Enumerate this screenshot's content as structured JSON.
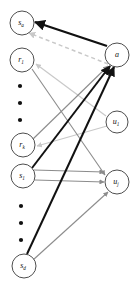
{
  "figure": {
    "background": "#ffffff"
  },
  "colors": {
    "node_stroke": "#3a3a3a",
    "node_fill": "#ffffff",
    "label": "#111111",
    "edge_black": "#111111",
    "edge_gray": "#8c8c8c",
    "edge_light_gray": "#c9c9c9",
    "edge_dashed_gray": "#c9c9c9"
  },
  "nodes": {
    "left": [
      {
        "id": "s_a",
        "base": "s",
        "sub": "a",
        "label": "s_a",
        "cx": 22,
        "cy": 23,
        "r": 12
      },
      {
        "id": "r_1",
        "base": "r",
        "sub": "1",
        "label": "r_1",
        "cx": 22,
        "cy": 60,
        "r": 12
      },
      {
        "id": "r_k",
        "base": "r",
        "sub": "k",
        "label": "r_k",
        "cx": 23,
        "cy": 145,
        "r": 12
      },
      {
        "id": "s_1",
        "base": "s",
        "sub": "1",
        "label": "s_1",
        "cx": 23,
        "cy": 176,
        "r": 12
      },
      {
        "id": "s_d",
        "base": "s",
        "sub": "d",
        "label": "s_d",
        "cx": 24,
        "cy": 266,
        "r": 12
      }
    ],
    "right": [
      {
        "id": "a",
        "base": "a",
        "sub": "",
        "label": "a",
        "cx": 117,
        "cy": 55,
        "r": 12
      },
      {
        "id": "u_1",
        "base": "u",
        "sub": "1",
        "label": "u_1",
        "cx": 117,
        "cy": 122,
        "r": 11
      },
      {
        "id": "u_j",
        "base": "u",
        "sub": "j",
        "label": "u_j",
        "cx": 117,
        "cy": 182,
        "r": 12
      }
    ]
  },
  "ellipses": [
    {
      "group": "left-upper",
      "cx": 20,
      "dots": [
        86,
        103,
        120
      ],
      "r": 2.1
    },
    {
      "group": "left-lower",
      "cx": 21,
      "dots": [
        206,
        223,
        240
      ],
      "r": 2.1
    }
  ],
  "edges": [
    {
      "id": "e1",
      "from": "a",
      "to": "s_a",
      "style": "solid",
      "color": "#111111",
      "width": 2.2,
      "arrow": "black"
    },
    {
      "id": "e2",
      "from": "a",
      "to": "s_a",
      "style": "dashed",
      "color": "#c9c9c9",
      "width": 1.4,
      "arrow": "light"
    },
    {
      "id": "e3",
      "from": "u_1",
      "to": "r_1",
      "style": "solid",
      "color": "#c9c9c9",
      "width": 1.2,
      "arrow": "light"
    },
    {
      "id": "e4",
      "from": "u_1",
      "to": "r_k",
      "style": "solid",
      "color": "#c9c9c9",
      "width": 1.2,
      "arrow": "light"
    },
    {
      "id": "e5",
      "from": "r_1",
      "to": "u_j",
      "style": "solid",
      "color": "#8c8c8c",
      "width": 1.1,
      "arrow": "gray"
    },
    {
      "id": "e6",
      "from": "r_k",
      "to": "a",
      "style": "solid",
      "color": "#8c8c8c",
      "width": 1.1,
      "arrow": "gray"
    },
    {
      "id": "e7",
      "from": "s_1",
      "to": "a",
      "style": "solid",
      "color": "#111111",
      "width": 2.0,
      "arrow": "black"
    },
    {
      "id": "e8",
      "from": "s_1",
      "to": "u_j",
      "style": "solid",
      "color": "#8c8c8c",
      "width": 1.1,
      "arrow": "gray"
    },
    {
      "id": "e9",
      "from": "s_d",
      "to": "a",
      "style": "solid",
      "color": "#111111",
      "width": 2.0,
      "arrow": "black"
    },
    {
      "id": "e10",
      "from": "s_d",
      "to": "u_j",
      "style": "solid",
      "color": "#8c8c8c",
      "width": 1.1,
      "arrow": "gray"
    },
    {
      "id": "e11",
      "from": "s_1",
      "to": "u_j_upper",
      "style": "solid",
      "color": "#8c8c8c",
      "width": 1.1,
      "arrow": "gray"
    }
  ],
  "geometry": {
    "width": 138,
    "height": 291
  }
}
